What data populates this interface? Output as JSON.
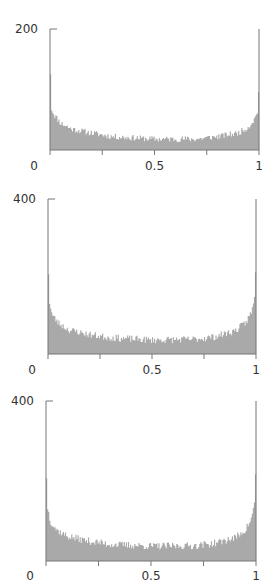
{
  "chart_data": [
    {
      "type": "bar",
      "subtype": "histogram",
      "title": "",
      "xlabel": "",
      "ylabel": "",
      "xlim": [
        0,
        1
      ],
      "ylim": [
        0,
        200
      ],
      "x_ticks": [
        0,
        0.25,
        0.5,
        0.75,
        1
      ],
      "x_tick_labels": [
        "0",
        "",
        "0.5",
        "",
        "1"
      ],
      "y_ticks": [
        200
      ],
      "y_tick_labels": [
        "200"
      ],
      "bins": 200,
      "grid": false,
      "legend": null,
      "profile": {
        "x": [
          0.0,
          0.005,
          0.02,
          0.05,
          0.1,
          0.2,
          0.3,
          0.5,
          0.7,
          0.8,
          0.9,
          0.95,
          0.98,
          0.995,
          1.0
        ],
        "y": [
          125,
          70,
          58,
          45,
          35,
          28,
          22,
          18,
          18,
          22,
          28,
          38,
          52,
          66,
          96
        ]
      },
      "noise": 5,
      "seed": 11,
      "layout": {
        "top": 10,
        "axis_x0": 50,
        "axis_x1": 259,
        "axis_y_top": 29,
        "axis_y_base": 150,
        "label_y": 170
      }
    },
    {
      "type": "bar",
      "subtype": "histogram",
      "title": "",
      "xlabel": "",
      "ylabel": "",
      "xlim": [
        0,
        1
      ],
      "ylim": [
        0,
        400
      ],
      "x_ticks": [
        0,
        0.25,
        0.5,
        0.75,
        1
      ],
      "x_tick_labels": [
        "0",
        "",
        "0.5",
        "",
        "1"
      ],
      "y_ticks": [
        400
      ],
      "y_tick_labels": [
        "400"
      ],
      "bins": 200,
      "grid": false,
      "legend": null,
      "profile": {
        "x": [
          0.0,
          0.005,
          0.02,
          0.05,
          0.1,
          0.2,
          0.3,
          0.5,
          0.7,
          0.8,
          0.9,
          0.95,
          0.98,
          0.995,
          1.0
        ],
        "y": [
          206,
          140,
          100,
          80,
          62,
          50,
          42,
          36,
          38,
          44,
          60,
          80,
          110,
          150,
          211
        ]
      },
      "noise": 9,
      "seed": 23,
      "layout": {
        "axis_x0": 48,
        "axis_x1": 256,
        "axis_y_top": 199,
        "axis_y_base": 354,
        "label_y": 374
      }
    },
    {
      "type": "bar",
      "subtype": "histogram",
      "title": "",
      "xlabel": "",
      "ylabel": "",
      "xlim": [
        0,
        1
      ],
      "ylim": [
        0,
        400
      ],
      "x_ticks": [
        0,
        0.25,
        0.5,
        0.75,
        1
      ],
      "x_tick_labels": [
        "0",
        "",
        "0.5",
        "",
        "1"
      ],
      "y_ticks": [
        400
      ],
      "y_tick_labels": [
        "400"
      ],
      "bins": 200,
      "grid": false,
      "legend": null,
      "profile": {
        "x": [
          0.0,
          0.005,
          0.02,
          0.05,
          0.1,
          0.2,
          0.3,
          0.5,
          0.7,
          0.8,
          0.9,
          0.95,
          0.98,
          0.995,
          1.0
        ],
        "y": [
          207,
          140,
          100,
          78,
          62,
          50,
          42,
          37,
          38,
          44,
          58,
          78,
          108,
          150,
          217
        ]
      },
      "noise": 9,
      "seed": 37,
      "layout": {
        "axis_x0": 46,
        "axis_x1": 256,
        "axis_y_top": 401,
        "axis_y_base": 561,
        "label_y": 580
      }
    }
  ],
  "colors": {
    "bar": "#a9a9a9",
    "axis": "#777777",
    "text": "#333333",
    "background": "#ffffff"
  }
}
